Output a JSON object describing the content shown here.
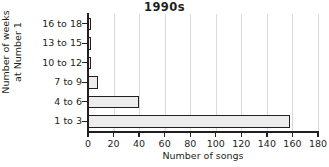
{
  "chart_data": {
    "type": "bar",
    "orientation": "horizontal",
    "title": "1990s",
    "xlabel": "Number of songs",
    "ylabel": "Number of weeks at Number 1",
    "ylabel_lines": [
      "Number of weeks",
      "at Number 1"
    ],
    "categories": [
      "1 to 3",
      "4 to 6",
      "7 to 9",
      "10 to 12",
      "13 to 15",
      "16 to 18"
    ],
    "values": [
      158,
      40,
      8,
      2,
      2,
      2
    ],
    "category_order_top_to_bottom": [
      "16 to 18",
      "13 to 15",
      "10 to 12",
      "7 to 9",
      "4 to 6",
      "1 to 3"
    ],
    "xlim": [
      0,
      180
    ],
    "xticks": [
      0,
      20,
      40,
      60,
      80,
      100,
      120,
      140,
      160,
      180
    ],
    "xtick_labels": [
      "0",
      "20",
      "40",
      "60",
      "80",
      "100",
      "120",
      "140",
      "160",
      "180"
    ],
    "grid": "vertical",
    "legend": null,
    "colors": {
      "bar_fill": "#ececec",
      "bar_border": "#231f20",
      "axis": "#231f20",
      "gridline": "#d9d9d9",
      "background": "#ffffff",
      "text": "#231f20"
    }
  }
}
